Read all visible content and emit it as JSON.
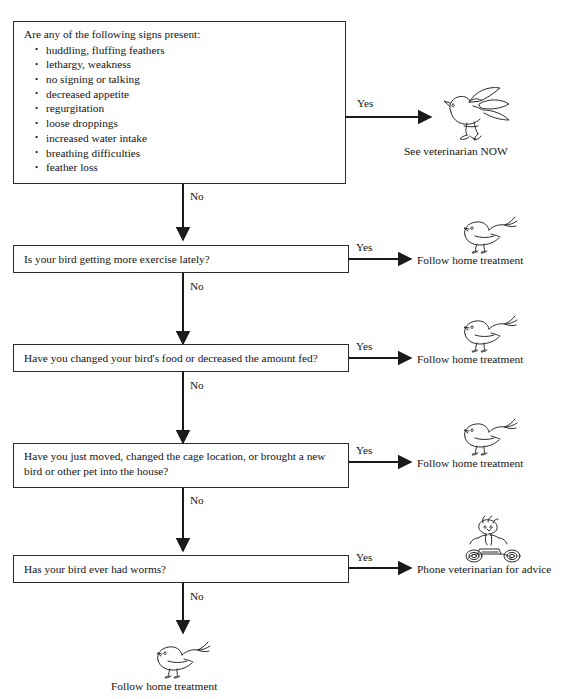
{
  "document": {
    "type": "decision-flowchart",
    "subject": "Sick bird triage flowchart"
  },
  "nodes": {
    "signs_question": {
      "lead": "Are any of the following signs present:",
      "items": [
        "huddling, fluffing feathers",
        "lethargy, weakness",
        "no signing or talking",
        "decreased appetite",
        "regurgitation",
        "loose droppings",
        "increased water intake",
        "breathing difficulties",
        "feather loss"
      ]
    },
    "exercise_question": {
      "text": "Is your bird getting more exercise lately?"
    },
    "food_question": {
      "text": "Have you changed your bird's food or decreased the amount fed?"
    },
    "environment_question": {
      "line1": "Have you just moved, changed the cage location, or brought a new",
      "line2": "bird or other pet into the house?"
    },
    "worms_question": {
      "text": "Has your bird ever had worms?"
    }
  },
  "edges": {
    "yes1": "Yes",
    "no1": "No",
    "yes2": "Yes",
    "no2": "No",
    "yes3": "Yes",
    "no3": "No",
    "yes4": "Yes",
    "no4": "No",
    "yes5": "Yes",
    "no5": "No"
  },
  "outcomes": {
    "vet_now": "See veterinarian NOW",
    "home_treatment_1": "Follow home treatment",
    "home_treatment_2": "Follow home treatment",
    "home_treatment_3": "Follow home treatment",
    "phone_vet": "Phone veterinarian for advice",
    "home_treatment_final": "Follow home treatment"
  },
  "illustrations": {
    "flying_bird": "flying-bird-icon",
    "resting_bird_1": "resting-bird-icon",
    "resting_bird_2": "resting-bird-icon",
    "resting_bird_3": "resting-bird-icon",
    "bird_on_phone": "bird-on-telephone-icon",
    "resting_bird_final": "resting-bird-icon"
  },
  "style": {
    "line_color": "#1a1a1a",
    "text_color": "#141414",
    "background": "#ffffff"
  }
}
